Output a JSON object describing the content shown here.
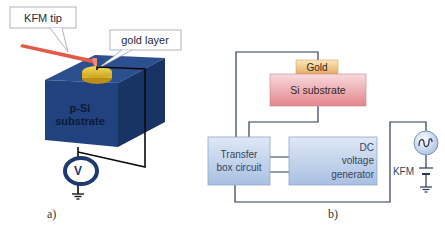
{
  "panel_a": {
    "caption": "a)",
    "callouts": {
      "kfm_tip": "KFM tip",
      "gold_layer": "gold layer"
    },
    "substrate_label_line1": "p-Si",
    "substrate_label_line2": "substrate",
    "voltmeter_label": "V",
    "icons": [
      "voltmeter-icon",
      "ground-icon"
    ]
  },
  "panel_b": {
    "caption": "b)",
    "gold_label": "Gold",
    "si_substrate_label": "Si substrate",
    "transfer_box_line1": "Transfer",
    "transfer_box_line2": "box circuit",
    "dc_gen_line1": "DC",
    "dc_gen_line2": "voltage",
    "dc_gen_line3": "generator",
    "kfm_label": "KFM",
    "icons": [
      "ac-source-icon",
      "battery-icon",
      "ground-icon"
    ]
  },
  "colors": {
    "cube_front": "#1f3f7a",
    "cube_top": "#2a4e8e",
    "cube_side": "#16305f",
    "gold": "#e8c53a",
    "tip": "#e25a4a",
    "si_substrate_top": "#f6d3d6",
    "si_substrate_bottom": "#e58c92",
    "gold_box_top": "#fbe3b6",
    "gold_box_bottom": "#e9b26a",
    "box_top": "#d9e4f3",
    "box_bottom": "#a8bfe0",
    "wire": "#2a3a55"
  }
}
